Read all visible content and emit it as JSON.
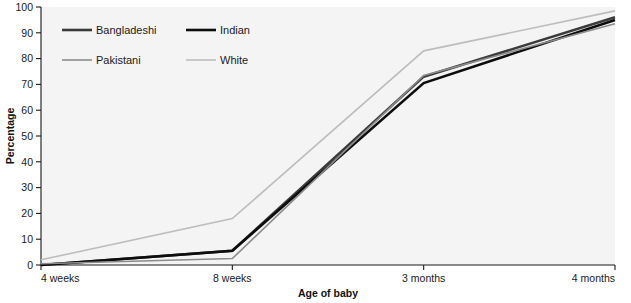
{
  "chart_data": {
    "type": "line",
    "title": "",
    "xlabel": "Age of baby",
    "ylabel": "Percentage",
    "categories": [
      "4 weeks",
      "8 weeks",
      "3 months",
      "4 months"
    ],
    "ylim": [
      0,
      100
    ],
    "yticks": [
      0,
      10,
      20,
      30,
      40,
      50,
      60,
      70,
      80,
      90,
      100
    ],
    "grid": false,
    "legend_position": "top-left",
    "series": [
      {
        "name": "Bangladeshi",
        "values": [
          0,
          5.5,
          73,
          96
        ],
        "color": "#3b3b3b",
        "width": 2.6
      },
      {
        "name": "Indian",
        "values": [
          0,
          5.5,
          70.5,
          95
        ],
        "color": "#0d0d0d",
        "width": 2.6
      },
      {
        "name": "Pakistani",
        "values": [
          0.5,
          2.5,
          73.5,
          93.5
        ],
        "color": "#8c8c8c",
        "width": 1.6
      },
      {
        "name": "White",
        "values": [
          2,
          18,
          83,
          98.5
        ],
        "color": "#bdbdbd",
        "width": 1.6
      }
    ]
  },
  "axes": {
    "y_tick_labels": [
      "0",
      "10",
      "20",
      "30",
      "40",
      "50",
      "60",
      "70",
      "80",
      "90",
      "100"
    ],
    "x_tick_labels": [
      "4 weeks",
      "8 weeks",
      "3 months",
      "4 months"
    ],
    "y_title": "Percentage",
    "x_title": "Age of baby"
  },
  "legend": {
    "entries": [
      {
        "label": "Bangladeshi",
        "color": "#3b3b3b",
        "width": 2.6
      },
      {
        "label": "Indian",
        "color": "#0d0d0d",
        "width": 2.6
      },
      {
        "label": "Pakistani",
        "color": "#8c8c8c",
        "width": 1.6
      },
      {
        "label": "White",
        "color": "#bdbdbd",
        "width": 1.6
      }
    ]
  },
  "colors": {
    "plot_background": "#f4f4f4",
    "page_background": "#ffffff",
    "axis": "#1a1a1a",
    "text": "#1a1a1a"
  }
}
